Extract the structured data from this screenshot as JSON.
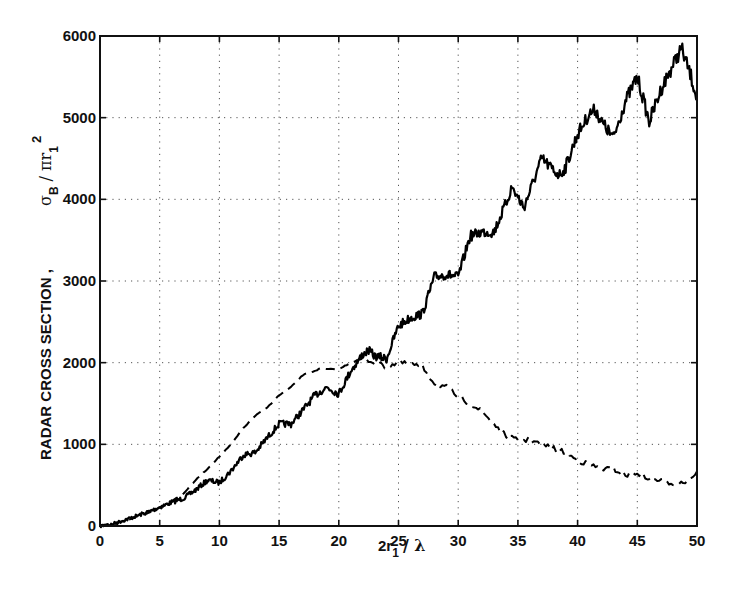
{
  "chart_data": {
    "type": "line",
    "title": "",
    "xlabel": "2r₁ / λ",
    "ylabel": "RADAR CROSS SECTION , σB / πr₁²",
    "xlim": [
      0,
      50
    ],
    "ylim": [
      0,
      6000
    ],
    "grid": true,
    "grid_style": "dotted",
    "legend": null,
    "x_ticks": [
      "0",
      "5",
      "10",
      "15",
      "20",
      "25",
      "30",
      "35",
      "40",
      "45",
      "50"
    ],
    "y_ticks": [
      "0",
      "1000",
      "2000",
      "3000",
      "4000",
      "5000",
      "6000"
    ],
    "series": [
      {
        "name": "solid",
        "style": "solid",
        "color": "#000000",
        "x": [
          0,
          1,
          2,
          3,
          4,
          5,
          6,
          7,
          8,
          9,
          10,
          11,
          12,
          13,
          14,
          15,
          16,
          17,
          18,
          19,
          20,
          21,
          22,
          22.5,
          23,
          24,
          25,
          26,
          27,
          28,
          29,
          30,
          31,
          32,
          33,
          34,
          34.5,
          35.5,
          36,
          37,
          38,
          38.5,
          39,
          40,
          41,
          41.5,
          42,
          43,
          44,
          45,
          46,
          47,
          48,
          48.7,
          49.5,
          50
        ],
        "y": [
          0,
          20,
          70,
          120,
          170,
          230,
          290,
          340,
          440,
          560,
          530,
          680,
          870,
          900,
          1080,
          1250,
          1250,
          1420,
          1600,
          1700,
          1620,
          1900,
          2100,
          2150,
          2080,
          2050,
          2450,
          2550,
          2600,
          3050,
          3080,
          3050,
          3550,
          3600,
          3600,
          3950,
          4150,
          3900,
          4100,
          4500,
          4350,
          4300,
          4400,
          4800,
          5050,
          5100,
          4950,
          4750,
          5200,
          5500,
          4950,
          5350,
          5650,
          5850,
          5500,
          5250
        ]
      },
      {
        "name": "dashed",
        "style": "dashed",
        "color": "#000000",
        "x": [
          0,
          2,
          4,
          5,
          6,
          7,
          8,
          9,
          10,
          11,
          12,
          13,
          14,
          15,
          16,
          17,
          18,
          18.5,
          19,
          20,
          21,
          22,
          23,
          24,
          25,
          26,
          27,
          28,
          29,
          30,
          31,
          32,
          33,
          34,
          35,
          36,
          37,
          38,
          39,
          40,
          41,
          42,
          43,
          44,
          45,
          46,
          47,
          48,
          49,
          50
        ],
        "y": [
          0,
          60,
          160,
          230,
          300,
          400,
          560,
          700,
          850,
          1000,
          1200,
          1350,
          1450,
          1600,
          1700,
          1850,
          1900,
          1930,
          1920,
          1920,
          2000,
          2050,
          2000,
          1950,
          2000,
          1980,
          1950,
          1750,
          1700,
          1580,
          1500,
          1400,
          1250,
          1100,
          1050,
          1050,
          1000,
          950,
          900,
          800,
          750,
          700,
          700,
          620,
          650,
          580,
          560,
          520,
          540,
          650
        ]
      }
    ]
  },
  "axes": {
    "x_title_main": "2r",
    "x_title_sub": "1",
    "x_title_rest": "/ λ",
    "y_title_text": "RADAR  CROSS  SECTION   ,",
    "y_title_sigma": "σ",
    "y_title_sigma_sub": "B",
    "y_title_rest": "/ πr",
    "y_title_r_sub": "1",
    "y_title_sup": "2"
  }
}
